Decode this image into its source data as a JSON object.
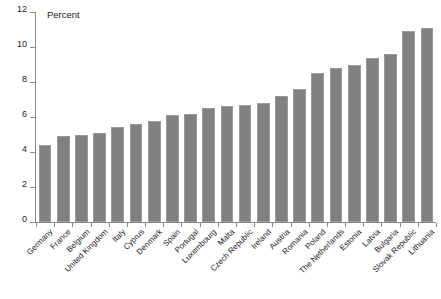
{
  "chart_data": {
    "type": "bar",
    "title": "",
    "subtitle": "",
    "unit_caption": "Percent",
    "xlabel": "",
    "ylabel": "",
    "ylim": [
      0,
      12
    ],
    "ytick_values": [
      0,
      2,
      4,
      6,
      8,
      10,
      12
    ],
    "ytick_labels": [
      "0",
      "2",
      "4",
      "6",
      "8",
      "10",
      "12"
    ],
    "grid": false,
    "legend": "none",
    "bar_color": "#808080",
    "bar_edge_color": "#9a9a9a",
    "axis_color": "#8a8a8a",
    "text_color": "#1a1a1a",
    "categories": [
      "Germany",
      "France",
      "Belgium",
      "United Kingdom",
      "Italy",
      "Cyprus",
      "Denmark",
      "Spain",
      "Portugal",
      "Luxembourg",
      "Malta",
      "Czech Republic",
      "Ireland",
      "Austria",
      "Romania",
      "Poland",
      "The Netherlands",
      "Estonia",
      "Latvia",
      "Bulgaria",
      "Slovak Republic",
      "Lithuania"
    ],
    "values": [
      4.4,
      4.9,
      5.0,
      5.1,
      5.45,
      5.6,
      5.75,
      6.1,
      6.2,
      6.5,
      6.65,
      6.7,
      6.8,
      7.2,
      7.6,
      8.5,
      8.8,
      9.0,
      9.35,
      9.6,
      10.9,
      11.1
    ]
  }
}
